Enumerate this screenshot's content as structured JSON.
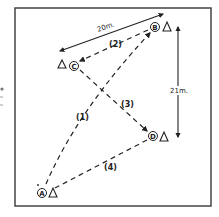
{
  "diagram": {
    "colors": {
      "ink": "#222222",
      "frame": "#444444",
      "background": "#ffffff"
    },
    "frame": {
      "x": 15,
      "y": 8,
      "width": 196,
      "height": 198
    },
    "points": [
      {
        "id": "A",
        "label": "A",
        "x": 42,
        "y": 193,
        "cone_x": 53,
        "cone_y": 193
      },
      {
        "id": "B",
        "label": "B",
        "x": 155,
        "y": 27,
        "cone_x": 167,
        "cone_y": 27
      },
      {
        "id": "C",
        "label": "C",
        "x": 74,
        "y": 66,
        "cone_x": 62,
        "cone_y": 64
      },
      {
        "id": "D",
        "label": "D",
        "x": 153,
        "y": 136,
        "cone_x": 164,
        "cone_y": 137
      }
    ],
    "paths": [
      {
        "id": "1",
        "label": "(1)",
        "from": "A",
        "to": "B",
        "style": "dashed-arrow"
      },
      {
        "id": "2",
        "label": "(2)",
        "from": "B",
        "to": "C",
        "style": "dashed-arrow"
      },
      {
        "id": "3",
        "label": "(3)",
        "from": "C",
        "to": "D",
        "style": "dashed-arrow"
      },
      {
        "id": "4",
        "label": "(4)",
        "from": "D",
        "to": "A",
        "style": "dashed"
      }
    ],
    "dimensions": [
      {
        "id": "width",
        "label": "20m.",
        "orientation": "diagonal"
      },
      {
        "id": "height",
        "label": "21m.",
        "orientation": "vertical"
      }
    ],
    "legend_icons": {
      "cone": "cone-triangle-icon",
      "point_marker": "circled-letter-icon"
    }
  }
}
